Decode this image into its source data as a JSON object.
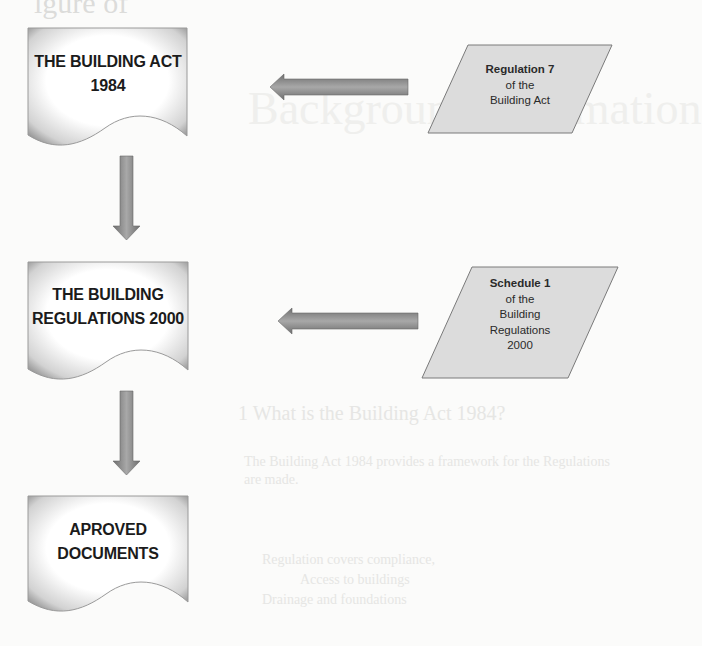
{
  "bleed_through": {
    "top_fragment": "igure of",
    "large_heading": "Background information",
    "section_heading": "1 What is the Building Act 1984?",
    "body_lines": [
      "The Building Act 1984 provides a framework for the Regulations",
      "are made.",
      "Regulation covers compliance, ",
      "Access to buildings",
      "Drainage and foundations"
    ]
  },
  "flowchart": {
    "documents": [
      {
        "id": "building-act",
        "lines": [
          "THE BUILDING ACT",
          "1984"
        ]
      },
      {
        "id": "building-regulations",
        "lines": [
          "THE BUILDING",
          "REGULATIONS 2000"
        ]
      },
      {
        "id": "approved-documents",
        "lines": [
          "APROVED",
          "DOCUMENTS"
        ]
      }
    ],
    "inputs": [
      {
        "id": "regulation-7",
        "title": "Regulation 7",
        "lines": [
          "of the",
          "Building Act"
        ]
      },
      {
        "id": "schedule-1",
        "title": "Schedule 1",
        "lines": [
          "of the",
          "Building",
          "Regulations",
          "2000"
        ]
      }
    ],
    "arrows": [
      {
        "from": "building-act",
        "to": "building-regulations",
        "direction": "down"
      },
      {
        "from": "building-regulations",
        "to": "approved-documents",
        "direction": "down"
      },
      {
        "from": "regulation-7",
        "to": "building-act",
        "direction": "left"
      },
      {
        "from": "schedule-1",
        "to": "building-regulations",
        "direction": "left"
      }
    ],
    "colors": {
      "document_fill": "#ffffff",
      "document_shadow": "#8a8a8a",
      "parallelogram_fill": "#dcdcdc",
      "parallelogram_stroke": "#7a7a7a",
      "arrow_fill": "#8c8c8c",
      "text": "#1b1b1b"
    }
  }
}
